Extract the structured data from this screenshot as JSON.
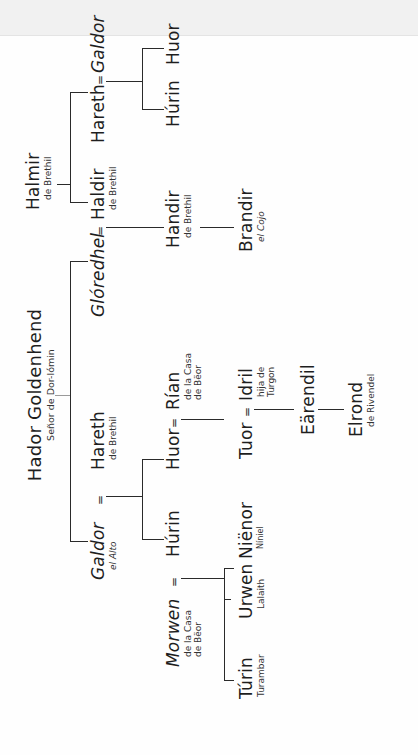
{
  "diagram": {
    "type": "family-tree",
    "orientation": "rotated-90-ccw",
    "root": {
      "name": "Hador Goldenhend",
      "title": "Señor de Dor-lómin"
    },
    "people": {
      "hador": {
        "name": "Hador Goldenhend",
        "sub": "Señor de Dor-lómin"
      },
      "galdor_alto": {
        "name": "Galdor",
        "sub": "el Alto"
      },
      "hareth_brethil": {
        "name": "Hareth",
        "sub": "de Brethil"
      },
      "gloredhel": {
        "name": "Glóredhel",
        "sub": ""
      },
      "haldir": {
        "name": "Haldir",
        "sub": "de Brethil"
      },
      "halmir": {
        "name": "Halmir",
        "sub": "de Brethil"
      },
      "hareth2": {
        "name": "Hareth",
        "sub": ""
      },
      "galdor2": {
        "name": "Galdor",
        "sub": ""
      },
      "hurin_top": {
        "name": "Húrin",
        "sub": ""
      },
      "huor_top": {
        "name": "Huor",
        "sub": ""
      },
      "handir": {
        "name": "Handir",
        "sub": "de Brethil"
      },
      "brandir": {
        "name": "Brandir",
        "sub": "el Cojo"
      },
      "hurin": {
        "name": "Húrin",
        "sub": ""
      },
      "huor": {
        "name": "Huor",
        "sub": ""
      },
      "rian": {
        "name": "Rían",
        "sub1": "de la Casa",
        "sub2": "de Bëor"
      },
      "morwen": {
        "name": "Morwen",
        "sub1": "de la Casa",
        "sub2": "de Bëor"
      },
      "turin": {
        "name": "Túrin",
        "sub": "Turambar"
      },
      "urwen": {
        "name": "Urwen",
        "sub": "Lalaith"
      },
      "nienor": {
        "name": "Niënor",
        "sub": "Níniel"
      },
      "tuor": {
        "name": "Tuor",
        "sub": ""
      },
      "idril": {
        "name": "Idril",
        "sub1": "hija de",
        "sub2": "Turgon"
      },
      "earendil": {
        "name": "Eärendil",
        "sub": ""
      },
      "elrond": {
        "name": "Elrond",
        "sub": "de Rivendel"
      }
    },
    "marriage_symbol": "=",
    "unions": [
      [
        "galdor_alto",
        "hareth_brethil"
      ],
      [
        "gloredhel",
        "haldir"
      ],
      [
        "hareth2",
        "galdor2"
      ],
      [
        "hurin",
        "morwen"
      ],
      [
        "huor",
        "rian"
      ],
      [
        "tuor",
        "idril"
      ]
    ],
    "colors": {
      "line": "#2a2a2a",
      "text": "#1e1e1e",
      "background": "#fefefe",
      "top_band": "#f1f1f1"
    }
  }
}
